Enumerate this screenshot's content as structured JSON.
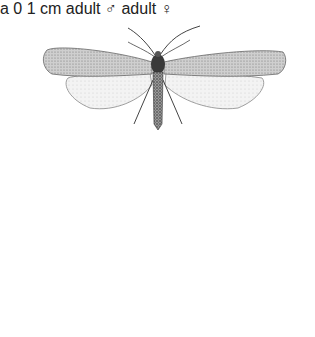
{
  "figure": {
    "male": {
      "label": "adult ♂",
      "sublabel": "a"
    },
    "female": {
      "label": "adult ♀"
    },
    "scale_bar": {
      "start": "0",
      "end": "1 cm"
    }
  },
  "colors": {
    "forewing_male": "#b9b9b9",
    "forewing_female": "#8e8e8e",
    "hindwing": "#ececec",
    "body": "#3a3a3a",
    "outline": "#555555"
  }
}
